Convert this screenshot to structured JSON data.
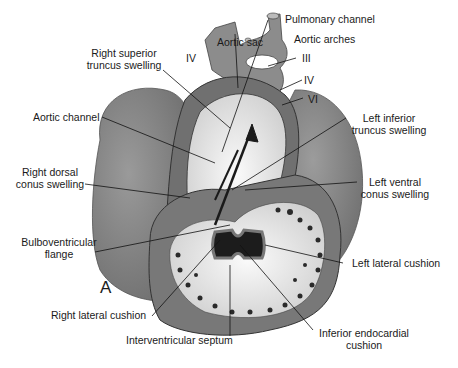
{
  "figure": {
    "panel_letter": "A"
  },
  "labels": {
    "pulmonary_channel": "Pulmonary channel",
    "aortic_sac": "Aortic sac",
    "aortic_arches": "Aortic arches",
    "arch_iii": "III",
    "arch_iv_right": "IV",
    "arch_iv_left": "IV",
    "arch_vi": "VI",
    "right_superior_truncus_line1": "Right superior",
    "right_superior_truncus_line2": "truncus swelling",
    "aortic_channel": "Aortic channel",
    "left_inferior_truncus_line1": "Left inferior",
    "left_inferior_truncus_line2": "truncus swelling",
    "right_dorsal_conus_line1": "Right dorsal",
    "right_dorsal_conus_line2": "conus swelling",
    "left_ventral_conus_line1": "Left ventral",
    "left_ventral_conus_line2": "conus swelling",
    "bulboventricular_line1": "Bulboventricular",
    "bulboventricular_line2": "flange",
    "left_lateral_cushion": "Left lateral cushion",
    "right_lateral_cushion": "Right lateral cushion",
    "interventricular_septum": "Interventricular septum",
    "inferior_endocardial_line1": "Inferior endocardial",
    "inferior_endocardial_line2": "cushion"
  },
  "colors": {
    "background": "#ffffff",
    "atrium_gray": "#8a8a8a",
    "ventricle_gray": "#7a7a7a",
    "wall_dark": "#6a6a6a",
    "cushion_light": "#e8e8e8",
    "lumen_black": "#1c1c1c",
    "leader_line": "#111111"
  }
}
